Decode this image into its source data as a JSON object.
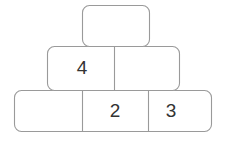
{
  "puzzle": {
    "type": "number-pyramid",
    "rows": [
      {
        "row_index": 0,
        "name": "top-row",
        "cells": [
          {
            "value": "",
            "filled": false
          }
        ]
      },
      {
        "row_index": 1,
        "name": "middle-row",
        "cells": [
          {
            "value": "4",
            "filled": true
          },
          {
            "value": "",
            "filled": false
          }
        ]
      },
      {
        "row_index": 2,
        "name": "bottom-row",
        "cells": [
          {
            "value": "",
            "filled": false
          },
          {
            "value": "2",
            "filled": true
          },
          {
            "value": "3",
            "filled": true
          }
        ]
      }
    ]
  },
  "colors": {
    "stroke": "#9a9a9a",
    "fill": "#ffffff",
    "text": "#333333",
    "background": "#ffffff"
  }
}
